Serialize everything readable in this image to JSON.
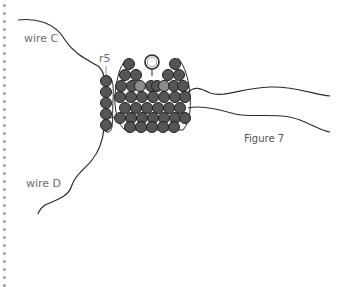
{
  "figure": {
    "caption": "Figure 7",
    "labels": {
      "wire_c": "wire C",
      "wire_d": "wire D",
      "row": "r5"
    },
    "colors": {
      "bead": "#555555",
      "bead_light": "#8c8c8c",
      "bead_stroke": "#222222",
      "wire": "#2a2a2a",
      "label": "#6e6e6e",
      "border_dot": "#9a9a9a"
    }
  }
}
